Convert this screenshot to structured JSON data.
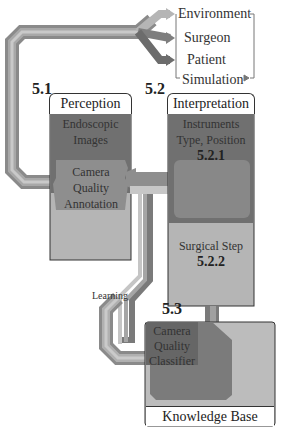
{
  "diagram": {
    "sources": {
      "environment": "Environment",
      "surgeon": "Surgeon",
      "patient": "Patient",
      "simulation": "Simulation"
    },
    "sections": {
      "perception": {
        "number": "5.1",
        "title": "Perception",
        "endoscopic_images": "Endoscopic Images",
        "camera_quality_annotation": "Camera Quality Annotation"
      },
      "interpretation": {
        "number": "5.2",
        "title": "Interpretation",
        "instruments": "Instruments Type, Position",
        "instruments_number": "5.2.1",
        "surgical_step": "Surgical Step",
        "surgical_step_number": "5.2.2"
      },
      "classifier": {
        "number": "5.3",
        "label": "Camera Quality Classifier"
      },
      "knowledge_base": {
        "title": "Knowledge Base"
      }
    },
    "edge_labels": {
      "learning": "Learning"
    },
    "colors": {
      "light_gray": "#c4c4c4",
      "mid_gray": "#9a9a9a",
      "dark_gray": "#777777",
      "darker_gray": "#6a6a6a",
      "stripe_light": "#bdbdbd",
      "stripe_dark": "#666666"
    }
  }
}
